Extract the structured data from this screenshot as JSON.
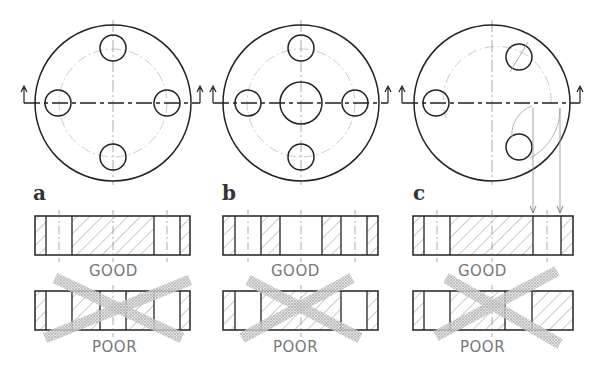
{
  "figure": {
    "panels": [
      {
        "id": "a",
        "label": "a",
        "good_caption": "GOOD",
        "poor_caption": "POOR",
        "description": "Flange with four equally spaced holes; section through two holes"
      },
      {
        "id": "b",
        "label": "b",
        "good_caption": "GOOD",
        "poor_caption": "POOR",
        "description": "Flange with four holes and a central bore"
      },
      {
        "id": "c",
        "label": "c",
        "good_caption": "GOOD",
        "poor_caption": "POOR",
        "description": "Flange with three holes; off-plane holes rotated into cutting plane"
      }
    ]
  }
}
